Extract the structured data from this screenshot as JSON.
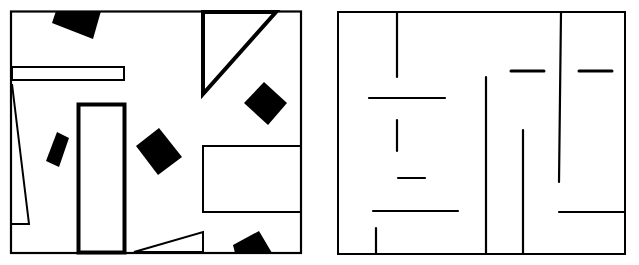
{
  "figure": {
    "panels": [
      {
        "name": "left-panel",
        "description": "Room with scattered black squares and outlined wall shapes",
        "border": [
          11,
          11,
          301,
          253
        ]
      },
      {
        "name": "right-panel",
        "description": "Maze-like room with line-segment walls",
        "border": [
          338,
          12,
          625,
          254
        ]
      }
    ],
    "colors": {
      "ink": "#000000",
      "paper": "#ffffff"
    }
  }
}
